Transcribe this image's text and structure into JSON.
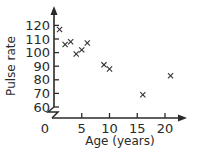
{
  "chart_data": {
    "type": "scatter",
    "title": "",
    "xlabel": "Age (years)",
    "ylabel": "Pulse rate",
    "xlim": [
      0,
      23
    ],
    "ylim": [
      60,
      125
    ],
    "x_ticks": [
      0,
      5,
      10,
      15,
      20
    ],
    "y_ticks": [
      60,
      70,
      80,
      90,
      100,
      110,
      120
    ],
    "x_tick_labels": [
      "0",
      "5",
      "10",
      "15",
      "20"
    ],
    "y_tick_labels": [
      "60",
      "70",
      "80",
      "90",
      "100",
      "110",
      "120"
    ],
    "y_axis_break": true,
    "grid": false,
    "legend": null,
    "marker": "x",
    "points": [
      {
        "x": 1,
        "y": 117
      },
      {
        "x": 2,
        "y": 106
      },
      {
        "x": 3,
        "y": 108
      },
      {
        "x": 4,
        "y": 99
      },
      {
        "x": 5,
        "y": 102
      },
      {
        "x": 6,
        "y": 107
      },
      {
        "x": 9,
        "y": 91
      },
      {
        "x": 10,
        "y": 88
      },
      {
        "x": 16,
        "y": 69
      },
      {
        "x": 21,
        "y": 83
      }
    ]
  }
}
